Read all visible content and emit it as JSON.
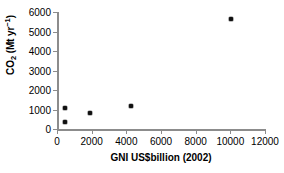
{
  "chart_data": {
    "type": "scatter",
    "title": "",
    "xlabel": "GNI US$billion (2002)",
    "ylabel": "CO2 (Mt yr-1)",
    "ylabel_parts": {
      "base": "CO",
      "sub": "2",
      "unit_open": " (Mt yr",
      "sup": "−1",
      "unit_close": ")"
    },
    "xlim": [
      0,
      12000
    ],
    "ylim": [
      0,
      6000
    ],
    "xticks": [
      0,
      2000,
      4000,
      6000,
      8000,
      10000,
      12000
    ],
    "xtick_labels": [
      "0",
      "2000",
      "4000",
      "6000",
      "8000",
      "10000",
      "12000"
    ],
    "yticks": [
      0,
      1000,
      2000,
      3000,
      4000,
      5000,
      6000
    ],
    "ytick_labels": [
      "0",
      "1000",
      "2000",
      "3000",
      "4000",
      "5000",
      "6000"
    ],
    "grid": false,
    "legend": null,
    "marker": "filled-diamond",
    "marker_color": "#111111",
    "axis_color": "#8c8c8c",
    "points": [
      {
        "x": 450,
        "y": 350,
        "label": ""
      },
      {
        "x": 460,
        "y": 1080,
        "label": ""
      },
      {
        "x": 1880,
        "y": 800,
        "label": ""
      },
      {
        "x": 4250,
        "y": 1180,
        "label": ""
      },
      {
        "x": 10050,
        "y": 5620,
        "label": ""
      }
    ]
  }
}
